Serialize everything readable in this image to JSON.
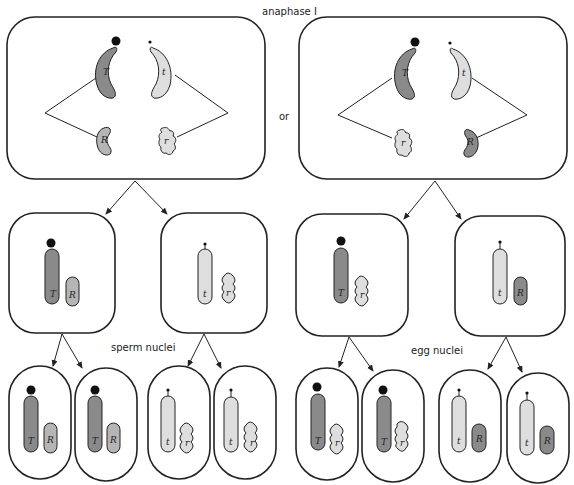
{
  "title": "anaphase I",
  "connector": "or",
  "labels": {
    "sperm": "sperm nuclei",
    "egg": "egg nuclei"
  },
  "colors": {
    "dark": "#8a8a8a",
    "medium": "#b5b5b5",
    "light": "#dedede",
    "outline": "#222222"
  },
  "anaphase_cells": [
    {
      "top_left": "T",
      "top_right": "t",
      "bottom_left": "R",
      "bottom_right": "r"
    },
    {
      "top_left": "T",
      "top_right": "t",
      "bottom_left": "r",
      "bottom_right": "R"
    }
  ],
  "daughter_cells": [
    {
      "long": "T",
      "short": "R"
    },
    {
      "long": "t",
      "short": "r"
    },
    {
      "long": "T",
      "short": "r"
    },
    {
      "long": "t",
      "short": "R"
    }
  ],
  "nuclei": [
    {
      "long": "T",
      "short": "R"
    },
    {
      "long": "T",
      "short": "R"
    },
    {
      "long": "t",
      "short": "r"
    },
    {
      "long": "t",
      "short": "r"
    },
    {
      "long": "T",
      "short": "r"
    },
    {
      "long": "T",
      "short": "r"
    },
    {
      "long": "t",
      "short": "R"
    },
    {
      "long": "t",
      "short": "R"
    }
  ]
}
